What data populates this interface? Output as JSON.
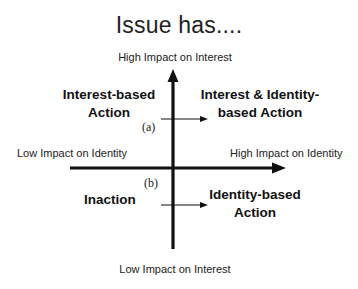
{
  "title": "Issue has....",
  "axes": {
    "top_label": "High Impact on Interest",
    "bottom_label": "Low Impact on Interest",
    "left_label": "Low Impact on Identity",
    "right_label": "High Impact on Identity"
  },
  "quadrants": {
    "top_left": [
      "Interest-based",
      "Action"
    ],
    "top_right": [
      "Interest & Identity-",
      "based Action"
    ],
    "bottom_left": [
      "Inaction"
    ],
    "bottom_right": [
      "Identity-based",
      "Action"
    ]
  },
  "markers": {
    "a": "(a)",
    "b": "(b)"
  }
}
